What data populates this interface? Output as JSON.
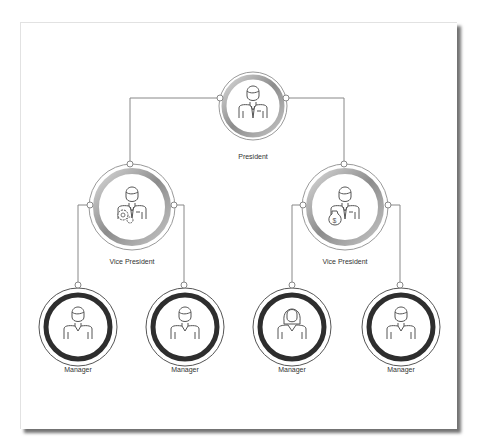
{
  "diagram": {
    "type": "org-chart",
    "nodes": [
      {
        "id": "president",
        "label": "President",
        "icon": "businessman-icon",
        "level": 0
      },
      {
        "id": "vp-operations",
        "label": "Vice President",
        "icon": "businessman-gears-icon",
        "level": 1,
        "parent": "president"
      },
      {
        "id": "vp-finance",
        "label": "Vice President",
        "icon": "businessman-money-bag-icon",
        "level": 1,
        "parent": "president"
      },
      {
        "id": "manager-1",
        "label": "Manager",
        "icon": "man-icon",
        "level": 2,
        "parent": "vp-operations"
      },
      {
        "id": "manager-2",
        "label": "Manager",
        "icon": "man-icon",
        "level": 2,
        "parent": "vp-operations"
      },
      {
        "id": "manager-3",
        "label": "Manager",
        "icon": "woman-icon",
        "level": 2,
        "parent": "vp-finance"
      },
      {
        "id": "manager-4",
        "label": "Manager",
        "icon": "man-icon",
        "level": 2,
        "parent": "vp-finance"
      }
    ]
  },
  "colors": {
    "line": "#888888",
    "ring_dark": "#333333",
    "ring_gray": "#9a9a9a",
    "icon": "#555555"
  }
}
